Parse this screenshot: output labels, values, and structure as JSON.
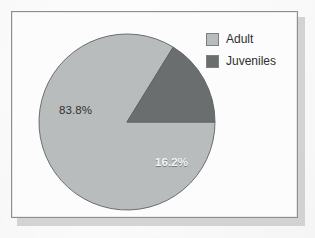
{
  "figure": {
    "background_color": "#fdfdfd",
    "frame_border_color": "#8c8f90",
    "plot_background_color": "#fcfcfc"
  },
  "legend": {
    "position": "top-right",
    "items": [
      {
        "label": "Adult",
        "color": "#b9bcbc",
        "swatch_name": "legend-swatch-adult"
      },
      {
        "label": "Juveniles",
        "color": "#6b6e6e",
        "swatch_name": "legend-swatch-juveniles"
      }
    ]
  },
  "labels": {
    "adult": "83.8%",
    "juveniles": "16.2%"
  },
  "chart_data": {
    "type": "pie",
    "title": "",
    "subtitle": "",
    "xlabel": "",
    "ylabel": "",
    "grid": false,
    "legend_position": "top-right",
    "start_angle_deg": 0,
    "direction": "clockwise",
    "center_px": [
      126,
      121
    ],
    "radius_px": 88,
    "labels": [
      "Adult",
      "Juveniles"
    ],
    "values": [
      83.8,
      16.2
    ],
    "value_unit": "percent",
    "data_labels": [
      "83.8%",
      "16.2%"
    ],
    "colors": [
      "#b9bcbc",
      "#6b6e6e"
    ],
    "slices": [
      {
        "label": "Adult",
        "value": 83.8,
        "data_label": "83.8%",
        "color": "#b9bcbc",
        "sweep_deg": 301.7,
        "label_color": "#2f3132"
      },
      {
        "label": "Juveniles",
        "value": 16.2,
        "data_label": "16.2%",
        "color": "#6b6e6e",
        "sweep_deg": 58.3,
        "label_color": "#f2f4f4"
      }
    ]
  }
}
